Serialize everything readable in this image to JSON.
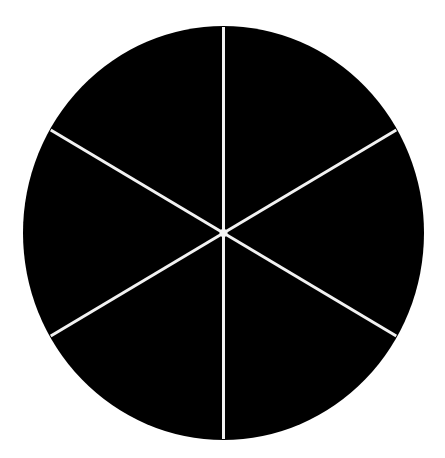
{
  "diagram": {
    "type": "divided-circle",
    "segments": 6,
    "fill_color": "#000000",
    "line_color": "#f2f2f2",
    "background_color": "#ffffff",
    "center": [
      223.5,
      233
    ],
    "radius_x": 200.5,
    "radius_y": 207,
    "divider_angles_deg": [
      90,
      30,
      -30,
      -90,
      -150,
      150
    ]
  }
}
